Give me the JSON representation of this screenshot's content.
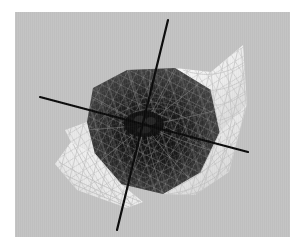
{
  "figure": {
    "background_color": "#ffffff",
    "panel_color": "#c2c2c2",
    "panel": {
      "x": 15,
      "y": 12,
      "width": 275,
      "height": 225
    }
  },
  "chart_data": {
    "type": "surface-3d-wireframe",
    "title": "",
    "xlabel": "",
    "ylabel": "",
    "zlabel": "",
    "grid": false,
    "legend": null,
    "render": {
      "shading": "grayscale",
      "mesh_visible": true,
      "mesh_subdivisions": 14,
      "dark_shell_color": "#141414",
      "mid_shell_color": "#3c3c3c",
      "light_lobe_color": "#f2f2f2",
      "mesh_line_color_on_dark": "#8c8c8c",
      "mesh_line_color_on_light": "#c8c8c8",
      "axis_color": "#0a0a0a",
      "axis_line_width": 2.2
    },
    "origin": {
      "x": 130,
      "y": 113
    },
    "axes": [
      {
        "name": "axis-vertical",
        "x1": 153,
        "y1": 8,
        "x2": 102,
        "y2": 218
      },
      {
        "name": "axis-horizontal",
        "x1": 25,
        "y1": 85,
        "x2": 233,
        "y2": 140
      },
      {
        "name": "axis-depth",
        "x1": 130,
        "y1": 113,
        "x2": 233,
        "y2": 140
      }
    ],
    "dark_shell_polygon": [
      [
        72,
        110
      ],
      [
        78,
        76
      ],
      [
        112,
        58
      ],
      [
        160,
        56
      ],
      [
        196,
        78
      ],
      [
        205,
        120
      ],
      [
        186,
        160
      ],
      [
        148,
        182
      ],
      [
        106,
        172
      ],
      [
        80,
        142
      ]
    ],
    "light_lobes": [
      {
        "name": "lobe-upper-right",
        "points": [
          [
            160,
            56
          ],
          [
            196,
            60
          ],
          [
            228,
            33
          ],
          [
            232,
            92
          ],
          [
            206,
            128
          ],
          [
            196,
            78
          ]
        ]
      },
      {
        "name": "lobe-lower-right",
        "points": [
          [
            205,
            120
          ],
          [
            232,
            92
          ],
          [
            214,
            160
          ],
          [
            180,
            183
          ],
          [
            148,
            182
          ],
          [
            186,
            160
          ]
        ]
      },
      {
        "name": "lobe-lower-left",
        "points": [
          [
            80,
            142
          ],
          [
            106,
            172
          ],
          [
            128,
            190
          ],
          [
            112,
            196
          ],
          [
            62,
            178
          ],
          [
            40,
            152
          ],
          [
            56,
            130
          ]
        ]
      },
      {
        "name": "lobe-left-fold",
        "points": [
          [
            72,
            110
          ],
          [
            80,
            142
          ],
          [
            56,
            130
          ],
          [
            50,
            118
          ]
        ]
      }
    ]
  },
  "elements": {
    "panel_name": "plot-panel",
    "surface_name": "surface-mesh"
  }
}
